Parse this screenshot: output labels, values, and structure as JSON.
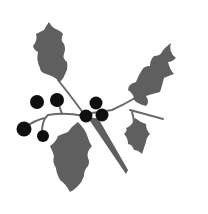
{
  "image": {
    "title": "Holly sprig clip art",
    "description": "Grayscale holly sprig with five leaves and seven black berries",
    "colors": {
      "background": "#ffffff",
      "leaf": "#5f5f5f",
      "stem": "#6a6a6a",
      "berry": "#0f0f0f"
    },
    "leaf_count": 5,
    "berry_count": 7
  }
}
